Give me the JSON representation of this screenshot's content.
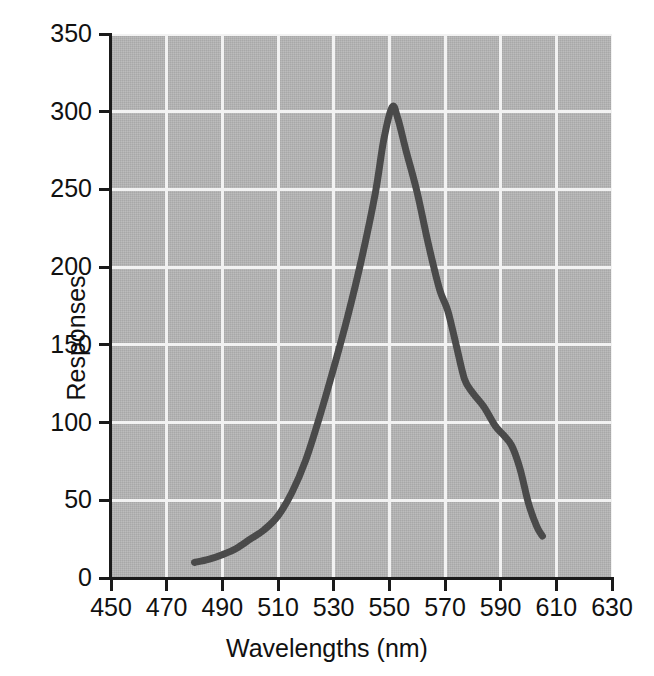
{
  "chart_data": {
    "type": "line",
    "title": "",
    "xlabel": "Wavelengths (nm)",
    "ylabel": "Responses",
    "xlim": [
      450,
      630
    ],
    "ylim": [
      0,
      350
    ],
    "xticks": [
      450,
      470,
      490,
      510,
      530,
      550,
      570,
      590,
      610,
      630
    ],
    "yticks": [
      0,
      50,
      100,
      150,
      200,
      250,
      300,
      350
    ],
    "xtick_labels": [
      "450",
      "470",
      "490",
      "510",
      "530",
      "550",
      "570",
      "590",
      "610",
      "630"
    ],
    "ytick_labels": [
      "0",
      "50",
      "100",
      "150",
      "200",
      "250",
      "300",
      "350"
    ],
    "grid": true,
    "grid_color": "#f2f2f2",
    "plot_background": "#b4b4b4",
    "legend": null,
    "series": [
      {
        "name": "Responses",
        "color": "#4a4a4a",
        "line_width": 7,
        "x": [
          480,
          485,
          490,
          495,
          500,
          505,
          510,
          515,
          520,
          525,
          530,
          535,
          540,
          545,
          548,
          551,
          553,
          556,
          560,
          564,
          568,
          571,
          574,
          577,
          580,
          584,
          588,
          591,
          594,
          597,
          600,
          603,
          605
        ],
        "y": [
          10,
          12,
          15,
          19,
          25,
          31,
          40,
          55,
          76,
          104,
          135,
          168,
          205,
          248,
          282,
          303,
          296,
          275,
          248,
          215,
          186,
          172,
          150,
          128,
          119,
          110,
          98,
          92,
          85,
          70,
          48,
          33,
          27
        ]
      }
    ]
  }
}
